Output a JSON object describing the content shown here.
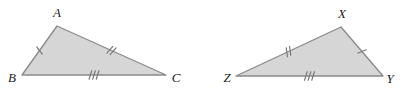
{
  "figure": {
    "background_color": "#ffffff",
    "fill_color": "#d6d6d6",
    "stroke_color": "#8a8a8a",
    "tick_color": "#7a7a7a",
    "label_color": "#1a1a1a"
  },
  "chart_data": {
    "type": "diagram",
    "shapes": [
      {
        "name": "triangle-abc",
        "vertices": [
          {
            "label": "A",
            "x": 57,
            "y": 26
          },
          {
            "label": "B",
            "x": 22,
            "y": 75
          },
          {
            "label": "C",
            "x": 166,
            "y": 75
          }
        ],
        "sides": [
          {
            "from": "A",
            "to": "B",
            "ticks": 1
          },
          {
            "from": "A",
            "to": "C",
            "ticks": 2
          },
          {
            "from": "B",
            "to": "C",
            "ticks": 3
          }
        ]
      },
      {
        "name": "triangle-xyz",
        "vertices": [
          {
            "label": "X",
            "x": 341,
            "y": 27
          },
          {
            "label": "Z",
            "x": 236,
            "y": 76
          },
          {
            "label": "Y",
            "x": 383,
            "y": 76
          }
        ],
        "sides": [
          {
            "from": "Z",
            "to": "X",
            "ticks": 2
          },
          {
            "from": "X",
            "to": "Y",
            "ticks": 1
          },
          {
            "from": "Z",
            "to": "Y",
            "ticks": 3
          }
        ]
      }
    ]
  },
  "labels": {
    "a": "A",
    "b": "B",
    "c": "C",
    "x": "X",
    "y": "Y",
    "z": "Z"
  },
  "label_positions": {
    "a": {
      "x": 57,
      "y": 17
    },
    "b": {
      "x": 12,
      "y": 82
    },
    "c": {
      "x": 176,
      "y": 82
    },
    "x": {
      "x": 342,
      "y": 18
    },
    "z": {
      "x": 227,
      "y": 82
    },
    "y": {
      "x": 390,
      "y": 83
    }
  }
}
